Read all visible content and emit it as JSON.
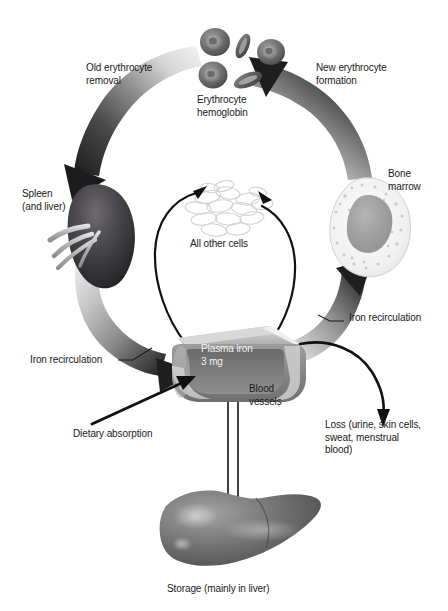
{
  "diagram": {
    "background": "#ffffff",
    "text_color": "#1a1a1a",
    "white_text_color": "#f2f2f2"
  },
  "labels": {
    "old_erythrocyte_removal": "Old erythrocyte\nremoval",
    "new_erythrocyte_formation": "New erythrocyte\nformation",
    "erythrocyte_hemoglobin": "Erythrocyte\nhemoglobin",
    "spleen_and_liver": "Spleen\n(and liver)",
    "bone_marrow": "Bone\nmarrow",
    "all_other_cells": "All other cells",
    "plasma_iron": "Plasma iron\n3 mg",
    "iron_recirculation_left": "Iron recirculation",
    "iron_recirculation_right": "Iron recirculation",
    "blood_vessels": "Blood\nvessels",
    "dietary_absorption": "Dietary absorption",
    "loss": "Loss (urine, skin cells,\nsweat, menstrual\nblood)",
    "storage": "Storage (mainly in liver)"
  },
  "structures": [
    {
      "name": "erythrocytes",
      "label_key": "erythrocyte_hemoglobin",
      "count": 5
    },
    {
      "name": "spleen",
      "label_key": "spleen_and_liver"
    },
    {
      "name": "bone-marrow",
      "label_key": "bone_marrow"
    },
    {
      "name": "all-other-cells",
      "label_key": "all_other_cells"
    },
    {
      "name": "blood-vessel",
      "label_key": "plasma_iron"
    },
    {
      "name": "liver",
      "label_key": "storage"
    }
  ],
  "flows": [
    {
      "name": "old-erythrocyte-removal",
      "from": "erythrocytes",
      "to": "spleen",
      "style": "gradient-band-arrow"
    },
    {
      "name": "new-erythrocyte-formation",
      "from": "bone-marrow",
      "to": "erythrocytes",
      "style": "gradient-band-arrow"
    },
    {
      "name": "iron-recirculation-left",
      "from": "spleen",
      "to": "blood-vessel",
      "style": "gradient-band-arrow"
    },
    {
      "name": "iron-recirculation-right",
      "from": "blood-vessel",
      "to": "bone-marrow",
      "style": "gradient-band-arrow"
    },
    {
      "name": "cells-uptake",
      "from": "blood-vessel",
      "to": "all-other-cells",
      "style": "thin-black-arrow"
    },
    {
      "name": "cells-return",
      "from": "all-other-cells",
      "to": "blood-vessel",
      "style": "thin-black-arrow"
    },
    {
      "name": "dietary-absorption",
      "to": "blood-vessel",
      "style": "thin-black-arrow"
    },
    {
      "name": "loss",
      "from": "blood-vessel",
      "style": "thin-black-arrow"
    },
    {
      "name": "storage-exchange",
      "from": "blood-vessel",
      "to": "liver",
      "style": "double-line-arrow"
    }
  ],
  "colors": {
    "band_dark": "#2f2f2f",
    "band_mid": "#8c8c8c",
    "band_light": "#e8e8e8",
    "vessel_gray": "#8a8a8a",
    "vessel_light": "#c9c9c9",
    "vessel_dark": "#6e6e6e",
    "cell_gray": "#7d7d7d",
    "marrow_core": "#9a9a9a",
    "liver_gray": "#6b6b6b",
    "arrow_black": "#111111"
  }
}
